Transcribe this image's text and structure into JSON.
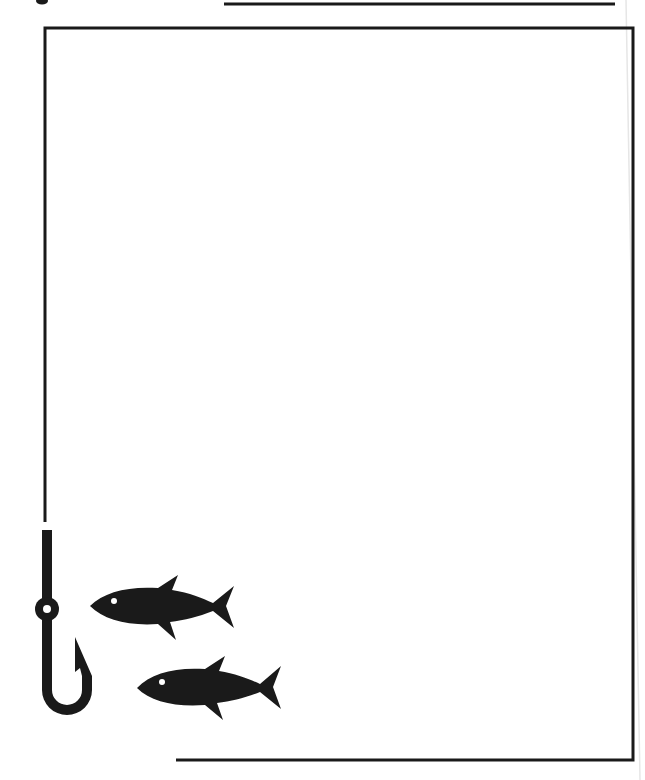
{
  "page": {
    "type": "fishing-themed border frame",
    "background_color": "#ffffff",
    "ink_color": "#1a1a1a",
    "description": "Blank page with a thin black rectangular frame; a fishing line descends on the left ending in a hook, with two fish swimming toward it."
  },
  "decorations": {
    "top_rule": {
      "x1": 224,
      "x2": 615,
      "y": 4
    },
    "frame": {
      "left_x": 45,
      "right_x": 633,
      "top_y": 28,
      "bottom_y": 760,
      "bottom_start_x": 176,
      "left_end_y": 522
    },
    "hook": {
      "shaft_x": 47,
      "shaft_top_y": 530,
      "eye_center": [
        47,
        609
      ],
      "eye_radius": 12
    },
    "fish": [
      {
        "label": "upper fish",
        "nose": [
          90,
          606
        ],
        "tail_x": 234,
        "eye": [
          114,
          601
        ]
      },
      {
        "label": "lower fish",
        "nose": [
          137,
          688
        ],
        "tail_x": 281,
        "eye": [
          162,
          682
        ]
      }
    ]
  }
}
